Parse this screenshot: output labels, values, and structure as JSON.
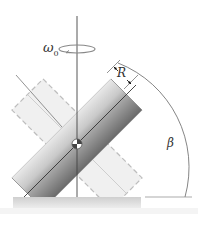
{
  "diagram": {
    "type": "rigid-body-rotation",
    "labels": {
      "omega_symbol": "ω",
      "omega_subscript": "0",
      "radius": "R",
      "angle": "β"
    },
    "elements": [
      "vertical rotation axis",
      "rotation arrow about vertical axis",
      "solid tilted cylinder",
      "dashed ghost cylinder (mirror orientation)",
      "center of mass marker",
      "radius dimension",
      "angle arc between base and cylinder axis",
      "base plate"
    ],
    "colors": {
      "cylinder_dark": "#7a7a7a",
      "cylinder_light": "#d9d9d9",
      "ghost_fill": "#efefef",
      "ghost_stroke": "#bdbdbd",
      "line": "#555555",
      "base": "#d6d6d6"
    }
  }
}
